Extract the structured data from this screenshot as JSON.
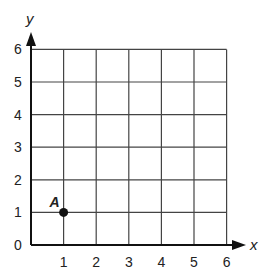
{
  "chart_data": {
    "type": "scatter",
    "title": "",
    "xlabel": "x",
    "ylabel": "y",
    "xlim": [
      0,
      6
    ],
    "ylim": [
      0,
      6
    ],
    "x_ticks": [
      "1",
      "2",
      "3",
      "4",
      "5",
      "6"
    ],
    "y_ticks": [
      "0",
      "1",
      "2",
      "3",
      "4",
      "5",
      "6"
    ],
    "grid": true,
    "legend": null,
    "points": [
      {
        "label": "A",
        "x": 1,
        "y": 1
      }
    ]
  },
  "colors": {
    "axis": "#111111",
    "grid": "#444444",
    "point": "#111111"
  }
}
